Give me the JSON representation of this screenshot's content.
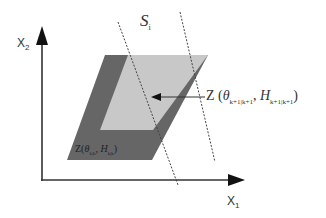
{
  "diagram": {
    "axes": {
      "x_label": "X",
      "x_sub": "1",
      "y_label": "X",
      "y_sub": "2"
    },
    "strip_label": {
      "symbol": "S",
      "sub": "i"
    },
    "zonotope_next": {
      "prefix": "Z (",
      "theta": "θ",
      "theta_sub": "k+1|k+1",
      "sep": ", ",
      "H": "H",
      "H_sub": "k+1|k+1",
      "suffix": ")"
    },
    "zonotope_current": {
      "prefix": "Z(",
      "theta": "θ",
      "theta_sub": "k|k",
      "sep": ", ",
      "H": "H",
      "H_sub": "k|k",
      "suffix": ")"
    },
    "colors": {
      "dark_zonotope": "#666666",
      "light_zonotope": "#c8c8c8",
      "axis": "#333333",
      "strip_line": "#444444"
    }
  }
}
